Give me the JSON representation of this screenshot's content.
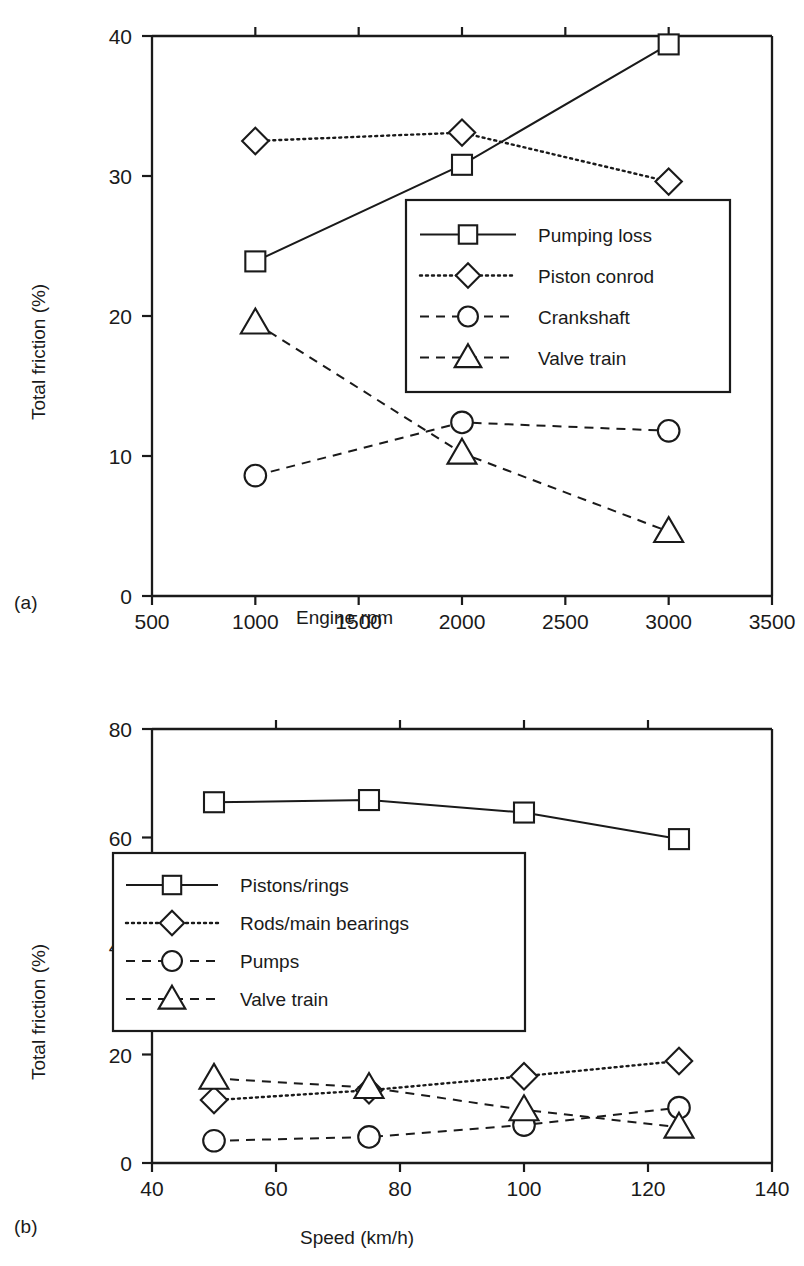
{
  "figure": {
    "panels": [
      {
        "tag": "(a)",
        "xlabel": "Engine rpm",
        "ylabel": "Total friction (%)"
      },
      {
        "tag": "(b)",
        "xlabel": "Speed (km/h)",
        "ylabel": "Total friction (%)"
      }
    ]
  },
  "chart_data": [
    {
      "type": "line",
      "title": "",
      "xlabel": "Engine rpm",
      "ylabel": "Total friction (%)",
      "xlim": [
        500,
        3500
      ],
      "ylim": [
        0,
        40
      ],
      "xticks": [
        500,
        1000,
        1500,
        2000,
        2500,
        3000,
        3500
      ],
      "yticks": [
        0,
        10,
        20,
        30,
        40
      ],
      "xticklabels": [
        "500",
        "1000",
        "1500",
        "2000",
        "2500",
        "3000",
        "3500"
      ],
      "yticklabels": [
        "0",
        "10",
        "20",
        "30",
        "40"
      ],
      "grid": false,
      "legend_position": "center-right",
      "x": [
        1000,
        2000,
        3000
      ],
      "series": [
        {
          "name": "Pumping loss",
          "marker": "square",
          "linestyle": "solid",
          "values": [
            23.9,
            30.8,
            39.4
          ]
        },
        {
          "name": "Piston conrod",
          "marker": "diamond",
          "linestyle": "dotted",
          "values": [
            32.5,
            33.1,
            29.6
          ]
        },
        {
          "name": "Crankshaft",
          "marker": "circle",
          "linestyle": "dashed",
          "values": [
            8.6,
            12.4,
            11.8
          ]
        },
        {
          "name": "Valve train",
          "marker": "triangle",
          "linestyle": "dashed",
          "values": [
            19.5,
            10.2,
            4.6
          ]
        }
      ]
    },
    {
      "type": "line",
      "title": "",
      "xlabel": "Speed (km/h)",
      "ylabel": "Total friction (%)",
      "xlim": [
        40,
        140
      ],
      "ylim": [
        0,
        80
      ],
      "xticks": [
        40,
        60,
        80,
        100,
        120,
        140
      ],
      "yticks": [
        0,
        20,
        40,
        60,
        80
      ],
      "xticklabels": [
        "40",
        "60",
        "80",
        "100",
        "120",
        "140"
      ],
      "yticklabels": [
        "0",
        "20",
        "40",
        "60",
        "80"
      ],
      "grid": false,
      "legend_position": "center-left",
      "x": [
        50,
        75,
        100,
        125
      ],
      "series": [
        {
          "name": "Pistons/rings",
          "marker": "square",
          "linestyle": "solid",
          "values": [
            66.5,
            66.9,
            64.6,
            59.7
          ]
        },
        {
          "name": "Rods/main bearings",
          "marker": "diamond",
          "linestyle": "dotted",
          "values": [
            11.6,
            13.4,
            16.0,
            18.8
          ]
        },
        {
          "name": "Pumps",
          "marker": "circle",
          "linestyle": "dashed",
          "values": [
            4.1,
            4.8,
            7.0,
            10.2
          ]
        },
        {
          "name": "Valve train",
          "marker": "triangle",
          "linestyle": "dashed",
          "values": [
            15.6,
            13.9,
            9.8,
            6.6
          ]
        }
      ]
    }
  ]
}
